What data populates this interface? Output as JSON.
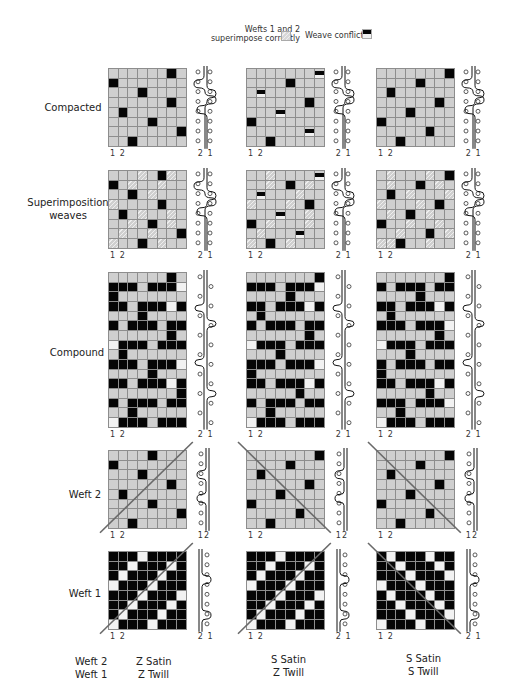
{
  "legend": {
    "correct_label_line1": "Wefts 1 and 2",
    "correct_label_line2": "superimpose correctly",
    "conflict_label": "Weave conflict",
    "colors": {
      "ground": "#cfcfcf",
      "warp_up": "#050505",
      "grid_line": "#8d8d8d",
      "hatch": "#eeeeee"
    }
  },
  "row_labels": {
    "compacted": "Compacted",
    "superimposition_line1": "Superimposition",
    "superimposition_line2": "weaves",
    "compound": "Compound",
    "weft2": "Weft 2",
    "weft1": "Weft 1"
  },
  "index_labels": {
    "bottom_left": "1 2",
    "bottom_right": "2 1",
    "bottom_right_weft2": "12"
  },
  "footer": {
    "row1_label": "Weft 2",
    "row2_label": "Weft 1",
    "columns": [
      {
        "weft2": "Z Satin",
        "weft1": "Z Twill"
      },
      {
        "weft2": "S Satin",
        "weft1": "Z Twill"
      },
      {
        "weft2": "S Satin",
        "weft1": "S Twill"
      }
    ]
  },
  "diagrams": {
    "compacted": [
      [
        "......b.",
        "b.......",
        "...b....",
        "......b.",
        ".b......",
        "....b...",
        ".......b",
        "..b....."
      ],
      [
        ".......x",
        "....b...",
        ".x......",
        "......b.",
        "...x....",
        "b.......",
        "......x.",
        "..b....."
      ],
      [
        ".......b",
        "....b...",
        ".b......",
        "......b.",
        "...b....",
        "b.......",
        ".....b..",
        "..b....."
      ]
    ],
    "superimposition": [
      [
        "...h.bh.",
        "b.h..h..",
        "..b.h...",
        "h....b..",
        ".b.h..h.",
        "..h.b.h.",
        ".h..h..b",
        "h..b.h.."
      ],
      [
        "..h....x",
        "..h.b.h.",
        ".x...h..",
        "h...h.b.",
        "...x..h.",
        "b.h...h.",
        ".h...x..",
        "h.b.h..."
      ],
      [
        ".h...h.b",
        ".h..b.h.",
        ".b.h...h",
        "h...h.b.",
        ".h.b.h..",
        "b..h..h.",
        "..h..b.h",
        "hhb..h.."
      ]
    ],
    "compound": [
      [
        "......b.",
        "bbb.bbbw",
        "b.......",
        "bb.bbbwb",
        "...b....",
        "b.bbb.bb",
        "......b.",
        "wbbb.bbb",
        ".b......",
        "bbb.bbbw",
        "....b...",
        "bb.bbbwb",
        ".......b",
        "b.bbb.bb",
        "..b.....",
        "wbbb.bbb"
      ],
      [
        ".......b",
        "bbb.bbbw",
        "....b...",
        "bb.bbbwb",
        ".b......",
        "b.bbb.bb",
        "......b.",
        "wbbb.bbb",
        "...b....",
        "bbb.bbbw",
        "b.......",
        "bb.bbbwb",
        ".....b..",
        "b.bbb.bb",
        "..b.....",
        "wbbb.bbb"
      ],
      [
        ".......b",
        "b.bbb.bb",
        "....b...",
        "bb.bbbwb",
        ".b......",
        "bbb.bbbw",
        "......b.",
        "wbbb.bbb",
        "...b....",
        "b.bbb.bb",
        "b.......",
        "bb.bbbwb",
        ".....b..",
        "bbb.bbbw",
        "..b.....",
        "wbbb.bbb"
      ]
    ],
    "weft2": [
      [
        "....b...",
        "b.......",
        "...b....",
        "......b.",
        ".b......",
        "....b...",
        ".......b",
        "..b....."
      ],
      [
        ".......b",
        "....b...",
        ".b......",
        "......b.",
        "...b....",
        "b.......",
        ".....b..",
        "..b....."
      ],
      [
        ".......b",
        "....b...",
        ".b......",
        "......b.",
        "...b....",
        "b.......",
        ".....b..",
        "..b....."
      ]
    ],
    "weft1": [
      [
        "bbbwbbbb",
        "bbwbbbwb",
        "bwbbbwbb",
        "wbbbwbbb",
        "bbbwbbbw",
        "bbwbbbwb",
        "bwbbbwbb",
        "wbbbwbbb"
      ],
      [
        "bbbwbbbb",
        "bbwbbbwb",
        "bwbbbwbb",
        "wbbbwbbb",
        "bbbwbbbw",
        "bbwbbbwb",
        "bwbbbwbb",
        "wbbbwbbb"
      ],
      [
        "bwbbbwbb",
        "bbwbbbwb",
        "bbbwbbbw",
        "wbbbwbbb",
        "bwbbbwbb",
        "bbwbbbwb",
        "bbbwbbbw",
        "wbbbwbbb"
      ]
    ]
  }
}
